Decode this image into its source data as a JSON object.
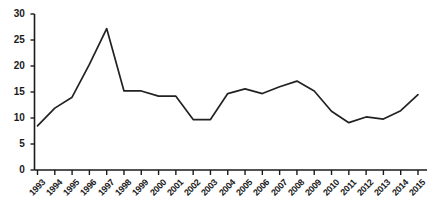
{
  "chart_data": {
    "type": "line",
    "title": "",
    "subtitle": "",
    "xlabel": "",
    "ylabel": "",
    "categories": [
      "1993",
      "1994",
      "1995",
      "1996",
      "1997",
      "1998",
      "1999",
      "2000",
      "2001",
      "2002",
      "2003",
      "2004",
      "2005",
      "2006",
      "2007",
      "2008",
      "2009",
      "2010",
      "2011",
      "2012",
      "2013",
      "2014",
      "2015"
    ],
    "values": [
      8.5,
      11.9,
      14.0,
      20.3,
      27.2,
      15.2,
      15.2,
      14.2,
      14.2,
      9.7,
      9.7,
      14.7,
      15.6,
      14.7,
      16.0,
      17.1,
      15.2,
      11.3,
      9.1,
      10.2,
      9.8,
      11.4,
      14.5
    ],
    "series": [
      {
        "name": "series-1",
        "values": [
          8.5,
          11.9,
          14.0,
          20.3,
          27.2,
          15.2,
          15.2,
          14.2,
          14.2,
          9.7,
          9.7,
          14.7,
          15.6,
          14.7,
          16.0,
          17.1,
          15.2,
          11.3,
          9.1,
          10.2,
          9.8,
          11.4,
          14.5
        ]
      }
    ],
    "ylim": [
      0,
      30
    ],
    "yticks": [
      0,
      5,
      10,
      15,
      20,
      25,
      30
    ],
    "ytick_labels": [
      "0",
      "5",
      "10",
      "15",
      "20",
      "25",
      "30"
    ],
    "xtick_labels": [
      "1993",
      "1994",
      "1995",
      "1996",
      "1997",
      "1998",
      "1999",
      "2000",
      "2001",
      "2002",
      "2003",
      "2004",
      "2005",
      "2006",
      "2007",
      "2008",
      "2009",
      "2010",
      "2011",
      "2012",
      "2013",
      "2014",
      "2015"
    ],
    "grid": false,
    "legend": false,
    "legend_position": "none",
    "line_color": "#222222",
    "axis_color": "#1a1a1a",
    "background_color": "#ffffff",
    "annotations": []
  }
}
